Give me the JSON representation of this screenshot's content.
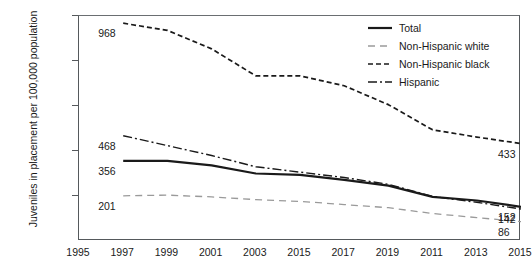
{
  "chart_data": {
    "type": "line",
    "title": "",
    "xlabel": "",
    "ylabel": "Juveniles in placement per 100,000 population",
    "ylim": [
      0,
      1000
    ],
    "yticks": [
      "0",
      "200",
      "400",
      "600",
      "800",
      "1,000"
    ],
    "ytick_values": [
      0,
      200,
      400,
      600,
      800,
      1000
    ],
    "xticks": [
      "1995",
      "1997",
      "1999",
      "2001",
      "2003",
      "2015",
      "2017",
      "2019",
      "2011",
      "2013",
      "2015"
    ],
    "xtick_values": [
      1995,
      1997,
      1999,
      2001,
      2003,
      2005,
      2007,
      2009,
      2011,
      2013,
      2015
    ],
    "grid": false,
    "legend_position": "top-right",
    "x": [
      1997,
      1999,
      2001,
      2003,
      2005,
      2007,
      2009,
      2011,
      2013,
      2015
    ],
    "series": [
      {
        "name": "Total",
        "style": "solid",
        "color": "#1a1a1a",
        "width": 2.2,
        "values": [
          356,
          356,
          336,
          300,
          294,
          272,
          246,
          196,
          180,
          152
        ],
        "start_label": "356",
        "end_label": "152"
      },
      {
        "name": "Non-Hispanic white",
        "style": "dashed",
        "color": "#9a9a9a",
        "width": 1.3,
        "values": [
          201,
          204,
          196,
          184,
          176,
          162,
          148,
          122,
          104,
          86
        ],
        "start_label": "201",
        "end_label": "86"
      },
      {
        "name": "Non-Hispanic black",
        "style": "fine-dashed",
        "color": "#1a1a1a",
        "width": 1.7,
        "values": [
          968,
          936,
          854,
          734,
          734,
          690,
          606,
          494,
          462,
          433
        ],
        "start_label": "968",
        "end_label": "433"
      },
      {
        "name": "Hispanic",
        "style": "dash-dot",
        "color": "#1a1a1a",
        "width": 1.4,
        "values": [
          468,
          424,
          380,
          330,
          306,
          282,
          252,
          198,
          172,
          142
        ],
        "start_label": "468",
        "end_label": "142"
      }
    ],
    "annotations": [
      {
        "text": "968",
        "series": "Non-Hispanic black",
        "side": "left"
      },
      {
        "text": "468",
        "series": "Hispanic",
        "side": "left"
      },
      {
        "text": "356",
        "series": "Total",
        "side": "left"
      },
      {
        "text": "201",
        "series": "Non-Hispanic white",
        "side": "left"
      },
      {
        "text": "433",
        "series": "Non-Hispanic black",
        "side": "right"
      },
      {
        "text": "152",
        "series": "Total",
        "side": "right"
      },
      {
        "text": "142",
        "series": "Hispanic",
        "side": "right"
      },
      {
        "text": "86",
        "series": "Non-Hispanic white",
        "side": "right"
      }
    ]
  }
}
